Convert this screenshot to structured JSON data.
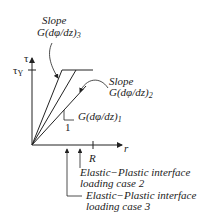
{
  "diagram": {
    "axes": {
      "y_label": "τ",
      "y_tick_label": "τ",
      "y_tick_sub": "Y",
      "x_label": "r",
      "x_tick_label": "R"
    },
    "slopes": [
      {
        "prefix": "G(dφ/dz)",
        "sub": "1"
      },
      {
        "title": "Slope",
        "prefix": "G(dφ/dz)",
        "sub": "2"
      },
      {
        "title": "Slope",
        "prefix": "G(dφ/dz)",
        "sub": "3"
      }
    ],
    "slope_triangle_label": "1",
    "interfaces": [
      {
        "line1": "Elastic−Plastic interface",
        "line2": "loading case 2"
      },
      {
        "line1": "Elastic−Plastic interface",
        "line2": "loading case 3"
      }
    ],
    "colors": {
      "ink": "#222222",
      "background": "#ffffff"
    }
  }
}
